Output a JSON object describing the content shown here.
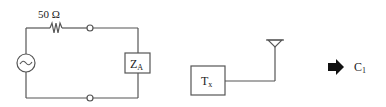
{
  "diagram": {
    "circuit": {
      "resistor_label": "50 Ω",
      "source_symbol": "~",
      "load_label": "Z",
      "load_subscript": "A"
    },
    "transmitter": {
      "label": "T",
      "subscript": "x"
    },
    "result": {
      "label": "C",
      "subscript": "1"
    },
    "colors": {
      "line": "#555555",
      "text": "#222222",
      "arrow": "#111111",
      "background": "#ffffff"
    }
  }
}
